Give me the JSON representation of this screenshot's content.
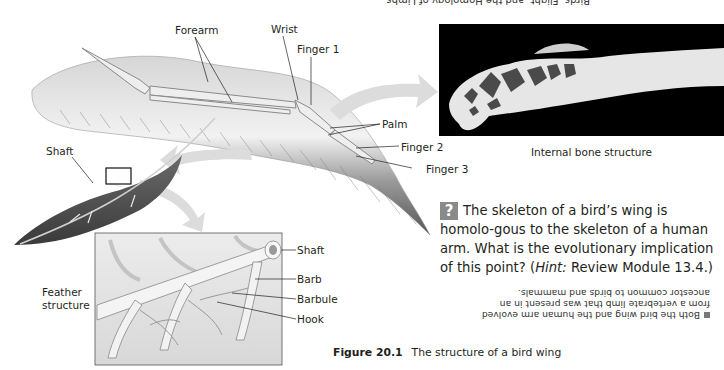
{
  "page": {
    "top_cut_text": "Birds, Flight, and the Homology of Limbs"
  },
  "wing_labels": {
    "forearm": "Forearm",
    "wrist": "Wrist",
    "finger1": "Finger 1",
    "palm": "Palm",
    "finger2": "Finger 2",
    "finger3": "Finger 3",
    "shaft": "Shaft"
  },
  "bone_photo": {
    "caption": "Internal bone structure"
  },
  "feather_structure": {
    "title_line1": "Feather",
    "title_line2": "structure",
    "labels": {
      "shaft": "Shaft",
      "barb": "Barb",
      "barbule": "Barbule",
      "hook": "Hook"
    }
  },
  "question": {
    "icon": "?",
    "text_before_hint": "The skeleton of a bird’s wing is homolo-gous to the skeleton of a human arm. What is the evolutionary implication of this point? (",
    "hint_word": "Hint:",
    "text_after_hint": " Review Module 13.4.)"
  },
  "answer": {
    "text": "Both the bird wing and the human arm evolved from a vertebrate limb that was present in an ancestor common to birds and mammals."
  },
  "figure": {
    "number": "Figure 20.1",
    "title": "The structure of a bird wing"
  },
  "colors": {
    "text": "#231f20",
    "arrow": "#d9d9d9",
    "icon_bg": "#8a8a8a",
    "photo_bg": "#000000"
  }
}
